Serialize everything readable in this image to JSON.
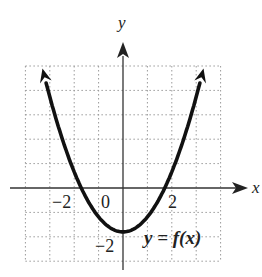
{
  "chart_data": {
    "type": "line",
    "title": "",
    "xlabel": "x",
    "ylabel": "y",
    "curve_label": "y = f(x)",
    "x_tick_labels": [
      {
        "value": -2,
        "text": "−2"
      },
      {
        "value": 0,
        "text": "0"
      },
      {
        "value": 2,
        "text": "2"
      }
    ],
    "y_tick_labels": [
      {
        "value": -2,
        "text": "−2"
      }
    ],
    "xlim": [
      -4,
      4
    ],
    "ylim": [
      -3,
      5
    ],
    "grid": true,
    "grid_style": "dotted",
    "series": [
      {
        "name": "y = f(x)",
        "shape": "upward parabola",
        "x_intercepts": [
          -1.75,
          1.75
        ],
        "vertex": [
          0,
          -1.8
        ],
        "arrow_ends": [
          [
            -3.3,
            4.9
          ],
          [
            3.3,
            4.9
          ]
        ],
        "points_estimated": [
          [
            -3.3,
            4.9
          ],
          [
            -3,
            3.9
          ],
          [
            -2.5,
            2.5
          ],
          [
            -2,
            1.2
          ],
          [
            -1.75,
            0
          ],
          [
            -1.5,
            -0.5
          ],
          [
            -1,
            -1.2
          ],
          [
            -0.5,
            -1.65
          ],
          [
            0,
            -1.8
          ],
          [
            0.5,
            -1.65
          ],
          [
            1,
            -1.2
          ],
          [
            1.5,
            -0.5
          ],
          [
            1.75,
            0
          ],
          [
            2,
            1.2
          ],
          [
            2.5,
            2.5
          ],
          [
            3,
            3.9
          ],
          [
            3.3,
            4.9
          ]
        ]
      }
    ]
  },
  "labels": {
    "x_axis": "x",
    "y_axis": "y",
    "origin": "0",
    "x_neg2": "−2",
    "x_pos2": "2",
    "y_neg2": "−2",
    "curve": "y = f(x)"
  },
  "colors": {
    "curve": "#111111",
    "axis": "#333333",
    "grid": "#9a9a9a"
  }
}
